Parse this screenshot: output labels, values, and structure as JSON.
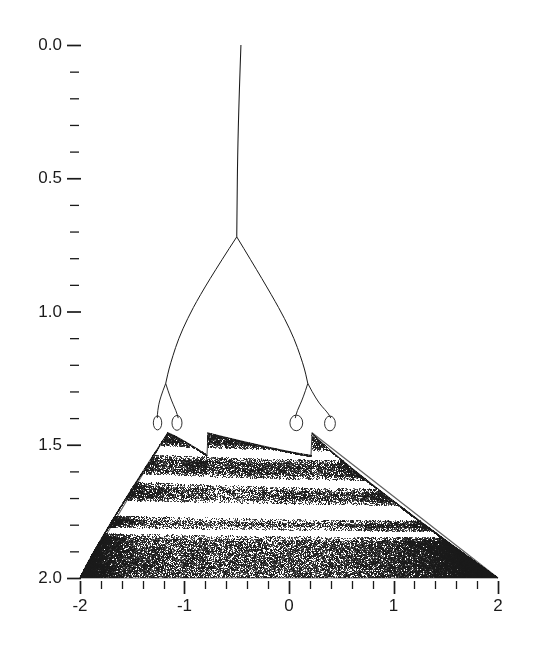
{
  "figure": {
    "type": "bifurcation-diagram",
    "background": "#ffffff",
    "ink": "#1a1a1a",
    "width": 534,
    "height": 661
  },
  "chart_data": {
    "type": "scatter",
    "title": "",
    "xlabel": "",
    "ylabel": "",
    "xlim": [
      -2,
      2
    ],
    "ylim": [
      2.0,
      0.0
    ],
    "y_axis_inverted": true,
    "grid": false,
    "legend": null,
    "x_ticks_major": [
      -2,
      -1,
      0,
      1,
      2
    ],
    "x_tick_labels": [
      "-2",
      "-1",
      "0",
      "1",
      "2"
    ],
    "x_tick_minor_step": 0.2,
    "y_ticks_major": [
      0.0,
      0.5,
      1.0,
      1.5,
      2.0
    ],
    "y_tick_labels": [
      "0.0",
      "0.5",
      "1.0",
      "1.5",
      "2.0"
    ],
    "y_tick_minor_step": 0.1,
    "features": {
      "primary_branch_start": [
        -0.46,
        0.0
      ],
      "first_pitchfork": [
        -0.5,
        0.72
      ],
      "second_bifurcations": [
        [
          -1.18,
          1.27
        ],
        [
          0.18,
          1.27
        ]
      ],
      "third_bifurcations": [
        [
          -1.26,
          1.4
        ],
        [
          -1.06,
          1.4
        ],
        [
          0.06,
          1.4
        ],
        [
          0.4,
          1.4
        ]
      ],
      "chaos_onset_y": 1.46,
      "left_apex": [
        -2.0,
        2.0
      ],
      "right_apex": [
        2.0,
        2.0
      ],
      "central_notch": [
        -0.78,
        1.54
      ],
      "white_band_levels": [
        1.51,
        1.62,
        1.73,
        1.8
      ]
    },
    "points_note": "Attractor rendered as dense stochastic point cloud inside the described envelope."
  },
  "axes": {
    "y_labels": [
      {
        "text": "0.0",
        "value": 0.0
      },
      {
        "text": "0.5",
        "value": 0.5
      },
      {
        "text": "1.0",
        "value": 1.0
      },
      {
        "text": "1.5",
        "value": 1.5
      },
      {
        "text": "2.0",
        "value": 2.0
      }
    ],
    "x_labels": [
      {
        "text": "-2",
        "value": -2
      },
      {
        "text": "-1",
        "value": -1
      },
      {
        "text": "0",
        "value": 0
      },
      {
        "text": "1",
        "value": 1
      },
      {
        "text": "2",
        "value": 2
      }
    ]
  }
}
